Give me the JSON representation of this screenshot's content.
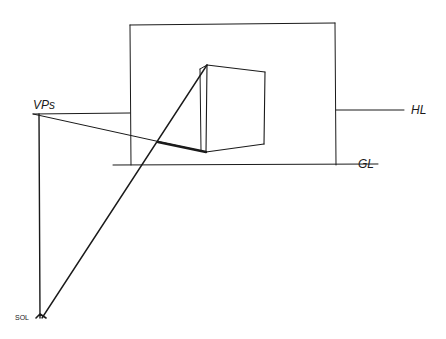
{
  "diagram": {
    "type": "perspective-drawing",
    "labels": {
      "vanishing_point": "VPs",
      "horizon_line": "HL",
      "ground_line": "GL",
      "station_point": "SOL"
    },
    "colors": {
      "ink": "#1a1a1a",
      "background": "#ffffff"
    }
  }
}
